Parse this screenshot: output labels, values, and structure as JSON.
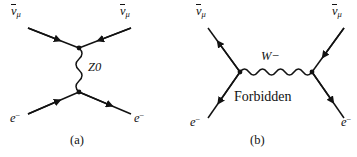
{
  "figure": {
    "background_color": "#ffffff",
    "line_color": "#121212",
    "width": 357,
    "height": 157
  },
  "diagrams": [
    {
      "id": "diagram-a",
      "caption": "(a)",
      "propagator": {
        "name": "Z0",
        "label_base": "Z",
        "label_sup": "0",
        "orientation": "vertical",
        "style": "wavy"
      },
      "incoming_labels": [
        {
          "name": "antineutrino-mu-top-left",
          "base": "ν",
          "sub": "μ",
          "overbar": true
        },
        {
          "name": "antineutrino-mu-top-right",
          "base": "ν",
          "sub": "μ",
          "overbar": true
        }
      ],
      "outgoing_labels": [
        {
          "name": "electron-bottom-left",
          "base": "e",
          "sup": "−",
          "overbar": false
        },
        {
          "name": "electron-bottom-right",
          "base": "e",
          "sup": "−",
          "overbar": false
        }
      ],
      "note": ""
    },
    {
      "id": "diagram-b",
      "caption": "(b)",
      "propagator": {
        "name": "W-minus",
        "label_base": "W",
        "label_sup": "−",
        "orientation": "horizontal",
        "style": "wavy"
      },
      "incoming_labels": [
        {
          "name": "antineutrino-mu-top-left",
          "base": "ν",
          "sub": "μ",
          "overbar": true
        },
        {
          "name": "antineutrino-mu-top-right",
          "base": "ν",
          "sub": "μ",
          "overbar": true
        }
      ],
      "outgoing_labels": [
        {
          "name": "electron-bottom-left",
          "base": "e",
          "sup": "−",
          "overbar": false
        },
        {
          "name": "electron-bottom-right",
          "base": "e",
          "sup": "−",
          "overbar": false
        }
      ],
      "note": "Forbidden"
    }
  ],
  "text": {
    "caption_a": "(a)",
    "caption_b": "(b)",
    "forbidden": "Forbidden",
    "z_base": "Z",
    "z_sup": "0",
    "w_base": "W",
    "w_sup": "−",
    "nu_base": "ν",
    "nu_sub": "μ",
    "e_base": "e",
    "e_sup": "−"
  }
}
